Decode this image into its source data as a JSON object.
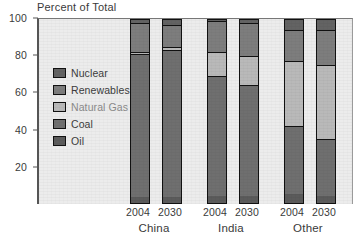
{
  "chart_data": {
    "type": "bar",
    "subtype": "stacked-bar-100",
    "title": "Percent of Total",
    "xlabel": "",
    "ylabel": "Percent of Total",
    "ylim": [
      0,
      100
    ],
    "yticks": [
      20,
      40,
      60,
      80,
      100
    ],
    "ytick_labels": [
      "20",
      "40",
      "60",
      "80",
      "100"
    ],
    "grid": false,
    "legend_position": "inside-upper-left",
    "groups": [
      "China",
      "India",
      "Other"
    ],
    "categories": [
      "2004",
      "2030",
      "2004",
      "2030",
      "2004",
      "2030"
    ],
    "bars": [
      {
        "group": "China",
        "year": "2004"
      },
      {
        "group": "China",
        "year": "2030"
      },
      {
        "group": "India",
        "year": "2004"
      },
      {
        "group": "India",
        "year": "2030"
      },
      {
        "group": "Other",
        "year": "2004"
      },
      {
        "group": "Other",
        "year": "2030"
      }
    ],
    "stack_order_bottom_to_top": [
      "Oil",
      "Coal",
      "Natural Gas",
      "Renewables",
      "Nuclear"
    ],
    "series": [
      {
        "name": "Oil",
        "color": "#5b5b5b",
        "values": [
          3,
          3,
          4,
          4,
          5,
          4
        ]
      },
      {
        "name": "Coal",
        "color": "#6f6f6f",
        "values": [
          78,
          80,
          65,
          60,
          37,
          31
        ]
      },
      {
        "name": "Natural Gas",
        "color": "#b9b9b9",
        "values": [
          1,
          2,
          13,
          16,
          35,
          40
        ]
      },
      {
        "name": "Renewables",
        "color": "#7d7d7d",
        "values": [
          16,
          12,
          17,
          18,
          17,
          19
        ]
      },
      {
        "name": "Nuclear",
        "color": "#636363",
        "values": [
          2,
          3,
          1,
          2,
          6,
          6
        ]
      }
    ]
  },
  "legend": {
    "items": [
      {
        "label": "Nuclear",
        "color": "#636363"
      },
      {
        "label": "Renewables",
        "color": "#7d7d7d"
      },
      {
        "label": "Natural Gas",
        "color": "#b9b9b9"
      },
      {
        "label": "Coal",
        "color": "#6f6f6f"
      },
      {
        "label": "Oil",
        "color": "#5b5b5b"
      }
    ]
  },
  "axis": {
    "y_ticks": [
      "100",
      "80",
      "60",
      "40",
      "20"
    ],
    "x_years": [
      "2004",
      "2030",
      "2004",
      "2030",
      "2004",
      "2030"
    ],
    "x_groups": [
      "China",
      "India",
      "Other"
    ]
  },
  "style": {
    "plot_background": "#ececec",
    "axis_color": "#555555",
    "bar_outline": "#111111"
  }
}
